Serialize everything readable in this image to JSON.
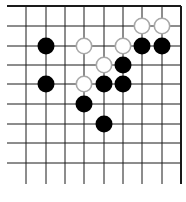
{
  "board": {
    "cols_x": [
      26,
      46,
      65,
      84,
      104,
      123,
      142,
      162,
      181
    ],
    "rows_y": [
      6,
      26,
      46,
      65,
      84,
      104,
      124,
      143,
      163
    ],
    "line_left_x": 7,
    "line_bottom_extend_y": 184,
    "edges": [
      "top",
      "right"
    ],
    "line_color": "#1a1a1a",
    "stone_radius": 8.5,
    "black_color": "#000000",
    "white_fill": "#ffffff",
    "white_stroke": "#a8a8a8",
    "stones": [
      {
        "color": "black",
        "col": 1,
        "row": 2
      },
      {
        "color": "black",
        "col": 1,
        "row": 4
      },
      {
        "color": "white",
        "col": 3,
        "row": 2
      },
      {
        "color": "white",
        "col": 5,
        "row": 2
      },
      {
        "color": "black",
        "col": 6,
        "row": 2
      },
      {
        "color": "black",
        "col": 7,
        "row": 2
      },
      {
        "color": "white",
        "col": 6,
        "row": 1
      },
      {
        "color": "white",
        "col": 7,
        "row": 1
      },
      {
        "color": "white",
        "col": 4,
        "row": 3
      },
      {
        "color": "black",
        "col": 5,
        "row": 3
      },
      {
        "color": "white",
        "col": 3,
        "row": 4
      },
      {
        "color": "black",
        "col": 4,
        "row": 4
      },
      {
        "color": "black",
        "col": 5,
        "row": 4
      },
      {
        "color": "black",
        "col": 3,
        "row": 5
      },
      {
        "color": "black",
        "col": 4,
        "row": 6
      }
    ]
  }
}
